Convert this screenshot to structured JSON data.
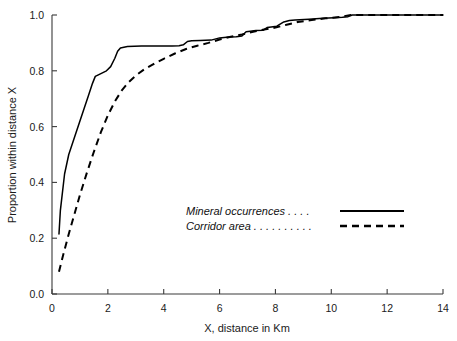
{
  "chart_data": {
    "type": "line",
    "title": "",
    "xlabel": "X, distance in Km",
    "ylabel": "Proportion within distance X",
    "xlim": [
      0,
      14
    ],
    "ylim": [
      0,
      1
    ],
    "xticks": [
      "0",
      "2",
      "4",
      "6",
      "8",
      "10",
      "12",
      "14"
    ],
    "xtick_values": [
      0,
      2,
      4,
      6,
      8,
      10,
      12,
      14
    ],
    "yticks": [
      "0.0",
      "0.2",
      "0.4",
      "0.6",
      "0.8",
      "1.0"
    ],
    "ytick_values": [
      0,
      0.2,
      0.4,
      0.6,
      0.8,
      1.0
    ],
    "grid": false,
    "legend_position": "center",
    "series": [
      {
        "name": "Mineral occurrences",
        "style": "solid",
        "color": "#000000",
        "x": [
          0.25,
          0.3,
          0.45,
          0.6,
          0.8,
          1.0,
          1.15,
          1.3,
          1.45,
          1.55,
          1.75,
          1.95,
          2.1,
          2.25,
          2.35,
          2.45,
          2.7,
          3.2,
          3.8,
          4.3,
          4.55,
          4.7,
          4.85,
          5.0,
          5.3,
          5.7,
          6.0,
          6.25,
          6.35,
          6.6,
          6.8,
          6.95,
          7.1,
          7.3,
          7.55,
          7.7,
          7.85,
          8.05,
          8.3,
          8.5,
          8.7,
          9.2,
          9.7,
          10.1,
          10.4,
          10.6,
          10.75,
          11.5,
          12.5,
          13.5,
          14.0
        ],
        "y": [
          0.215,
          0.3,
          0.43,
          0.5,
          0.56,
          0.62,
          0.665,
          0.71,
          0.755,
          0.78,
          0.79,
          0.8,
          0.815,
          0.845,
          0.87,
          0.882,
          0.887,
          0.889,
          0.889,
          0.889,
          0.89,
          0.893,
          0.905,
          0.908,
          0.909,
          0.91,
          0.918,
          0.92,
          0.921,
          0.922,
          0.925,
          0.94,
          0.942,
          0.944,
          0.945,
          0.955,
          0.957,
          0.96,
          0.975,
          0.98,
          0.982,
          0.985,
          0.988,
          0.99,
          0.992,
          0.994,
          1.0,
          1.0,
          1.0,
          1.0,
          1.0
        ]
      },
      {
        "name": "Corridor area",
        "style": "dashed",
        "color": "#000000",
        "x": [
          0.25,
          0.4,
          0.6,
          0.8,
          1.0,
          1.25,
          1.5,
          1.75,
          2.0,
          2.25,
          2.5,
          2.75,
          3.0,
          3.3,
          3.6,
          4.0,
          4.4,
          4.8,
          5.2,
          5.6,
          6.0,
          6.4,
          6.8,
          7.2,
          7.6,
          8.0,
          8.4,
          8.8,
          9.3,
          9.8,
          10.3,
          10.7,
          11.5,
          12.5,
          13.5,
          14.0
        ],
        "y": [
          0.08,
          0.14,
          0.215,
          0.285,
          0.355,
          0.435,
          0.51,
          0.58,
          0.64,
          0.69,
          0.73,
          0.76,
          0.783,
          0.805,
          0.822,
          0.843,
          0.862,
          0.878,
          0.89,
          0.9,
          0.912,
          0.922,
          0.93,
          0.94,
          0.948,
          0.955,
          0.965,
          0.975,
          0.982,
          0.988,
          0.993,
          1.0,
          1.0,
          1.0,
          1.0,
          1.0
        ]
      }
    ],
    "legend": [
      {
        "label": "Mineral occurrences",
        "leader": " . . . .",
        "style": "solid"
      },
      {
        "label": "Corridor area",
        "leader": " . . . . . . . . . .",
        "style": "dashed"
      }
    ]
  }
}
